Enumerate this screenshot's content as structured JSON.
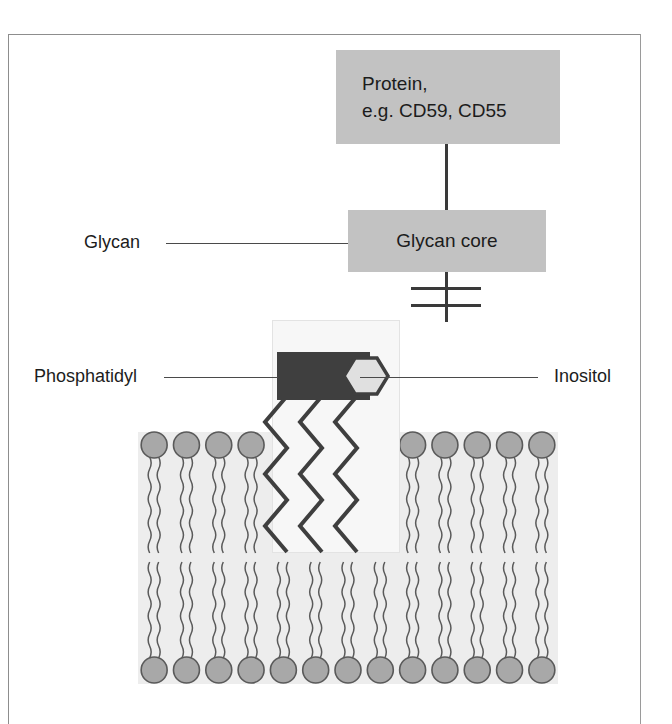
{
  "figure": {
    "background_color": "#ffffff",
    "frame_color": "#8d8d8d"
  },
  "nodes": {
    "protein": {
      "label_line1": "Protein,",
      "label_line2": "e.g. CD59, CD55",
      "fill_color": "#c2c2c2",
      "text_color": "#1c1c1c"
    },
    "glycan_core": {
      "label": "Glycan core",
      "fill_color": "#c2c2c2",
      "text_color": "#1c1c1c"
    }
  },
  "callouts": {
    "glycan": {
      "label": "Glycan",
      "side": "left"
    },
    "phosphatidyl": {
      "label": "Phosphatidyl",
      "side": "left"
    },
    "inositol": {
      "label": "Inositol",
      "side": "right"
    }
  },
  "gpi_anchor": {
    "highlight_fill": "#f7f7f7",
    "phosphatidyl_block_color": "#3f3f3f",
    "inositol_hexagon_fill": "#e0e0e0",
    "inositol_hexagon_stroke": "#3f3f3f",
    "tail_count": 3,
    "tail_style": "zigzag",
    "tail_color": "#3f3f3f"
  },
  "membrane": {
    "fill_color": "#ededed",
    "head_fill": "#a8a8a8",
    "head_stroke": "#5a5a5a",
    "tail_color": "#5a5a5a",
    "head_radius": 13,
    "upper_leaflet_left_count": 4,
    "upper_leaflet_right_count": 5,
    "lower_leaflet_count": 13,
    "leaflets": [
      "upper",
      "lower"
    ]
  },
  "connectors": {
    "protein_to_glycan_core": {
      "type": "vertical-line",
      "color": "#3a3a3a"
    },
    "glycan_core_to_anchor": {
      "type": "phosphodiester-linker",
      "bars": 2,
      "color": "#3a3a3a"
    }
  }
}
